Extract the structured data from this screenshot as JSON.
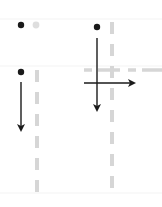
{
  "diagram": {
    "kind": "gesture-illustration",
    "colors": {
      "background": "#ffffff",
      "ink": "#1a1a1a",
      "guide": "#d9d9d9",
      "ghost_dot": "#dddddd",
      "separator": "#f2f2f2"
    },
    "panels": [
      {
        "id": "tap",
        "touch_point": [
          21,
          25
        ],
        "ghost_point": [
          36,
          25
        ]
      },
      {
        "id": "drag-vertical-and-horizontal",
        "touch_point": [
          97,
          27
        ],
        "arrows": [
          "down",
          "right"
        ]
      },
      {
        "id": "drag-down",
        "touch_point": [
          21,
          72
        ],
        "arrows": [
          "down"
        ]
      }
    ]
  }
}
